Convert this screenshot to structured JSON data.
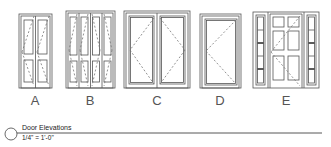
{
  "drawing": {
    "title": "Door Elevations",
    "scale": "1/4\" = 1'-0\"",
    "line_color": "#555555",
    "background": "#ffffff"
  },
  "doors": [
    {
      "label": "A",
      "type": "double-door-4-panel"
    },
    {
      "label": "B",
      "type": "bi-fold-4-leaf-panel"
    },
    {
      "label": "C",
      "type": "french-double-glass"
    },
    {
      "label": "D",
      "type": "single-glass"
    },
    {
      "label": "E",
      "type": "6-panel-with-sidelights"
    }
  ]
}
